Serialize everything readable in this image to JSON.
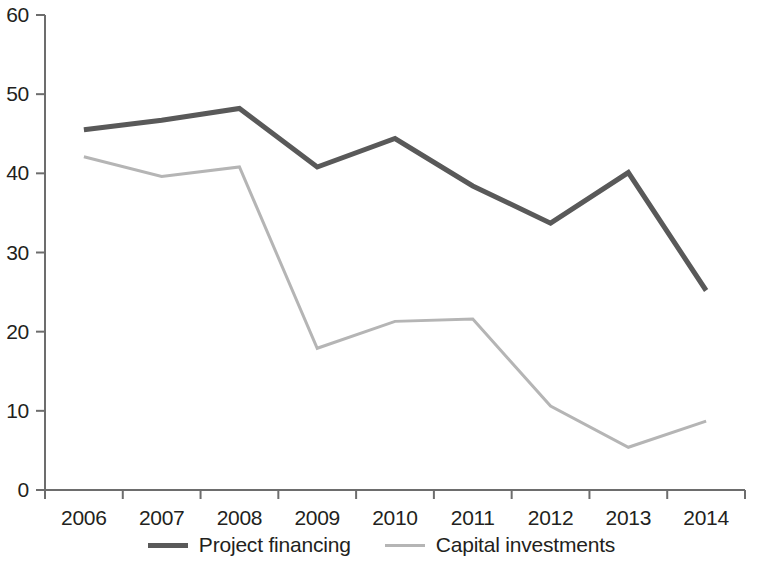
{
  "chart_data": {
    "type": "line",
    "title": "",
    "xlabel": "",
    "ylabel": "",
    "categories": [
      "2006",
      "2007",
      "2008",
      "2009",
      "2010",
      "2011",
      "2012",
      "2013",
      "2014"
    ],
    "ylim": [
      0,
      60
    ],
    "ytick_labels": [
      "0",
      "10",
      "20",
      "30",
      "40",
      "50",
      "60"
    ],
    "yticks": [
      0,
      10,
      20,
      30,
      40,
      50,
      60
    ],
    "grid": false,
    "legend_position": "bottom-center",
    "series": [
      {
        "name": "Project financing",
        "color": "#595959",
        "line_width": 5,
        "values": [
          45.5,
          46.7,
          48.2,
          40.8,
          44.4,
          38.4,
          33.7,
          40.1,
          25.2
        ]
      },
      {
        "name": "Capital investments",
        "color": "#b5b5b5",
        "line_width": 3,
        "values": [
          42.1,
          39.6,
          40.8,
          17.9,
          21.3,
          21.6,
          10.6,
          5.4,
          8.7
        ]
      }
    ]
  },
  "axis": {
    "line_color": "#6d6d6d"
  }
}
